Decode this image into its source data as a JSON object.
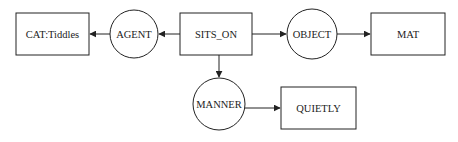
{
  "diagram": {
    "type": "conceptual-graph",
    "nodes": {
      "sits_on": {
        "label": "SITS_ON",
        "shape": "box"
      },
      "agent": {
        "label": "AGENT",
        "shape": "circle"
      },
      "cat": {
        "label": "CAT:Tiddles",
        "shape": "box"
      },
      "object": {
        "label": "OBJECT",
        "shape": "circle"
      },
      "mat": {
        "label": "MAT",
        "shape": "box"
      },
      "manner": {
        "label": "MANNER",
        "shape": "circle"
      },
      "quietly": {
        "label": "QUIETLY",
        "shape": "box"
      }
    },
    "edges": [
      {
        "from": "SITS_ON",
        "to": "AGENT"
      },
      {
        "from": "AGENT",
        "to": "CAT:Tiddles"
      },
      {
        "from": "SITS_ON",
        "to": "OBJECT"
      },
      {
        "from": "OBJECT",
        "to": "MAT"
      },
      {
        "from": "SITS_ON",
        "to": "MANNER"
      },
      {
        "from": "MANNER",
        "to": "QUIETLY"
      }
    ],
    "colors": {
      "stroke": "#222222",
      "background": "#ffffff"
    }
  }
}
